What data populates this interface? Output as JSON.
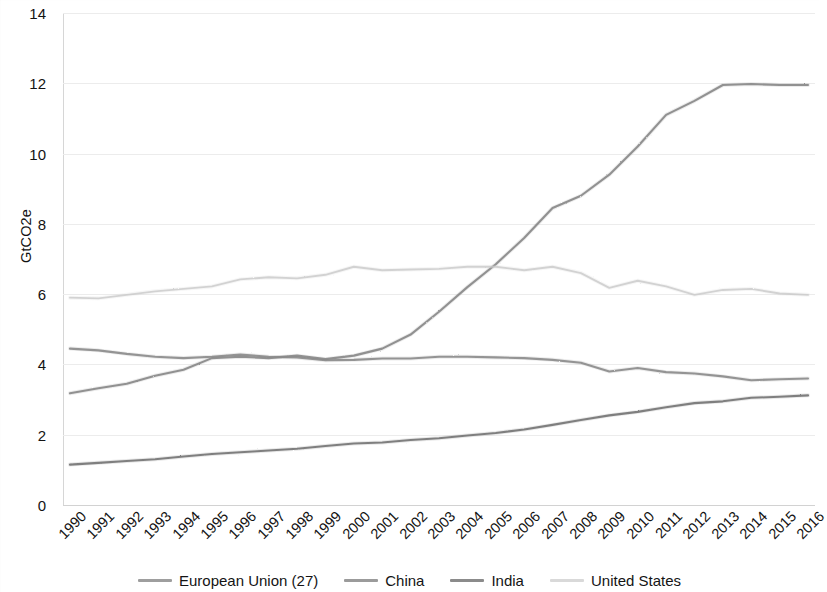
{
  "chart_data": {
    "type": "line",
    "title": "",
    "xlabel": "",
    "ylabel": "GtCO2e",
    "ylim": [
      0,
      14
    ],
    "yticks": [
      0,
      2,
      4,
      6,
      8,
      10,
      12,
      14
    ],
    "grid": true,
    "legend_position": "bottom",
    "x": [
      1990,
      1991,
      1992,
      1993,
      1994,
      1995,
      1996,
      1997,
      1998,
      1999,
      2000,
      2001,
      2002,
      2003,
      2004,
      2005,
      2006,
      2007,
      2008,
      2009,
      2010,
      2011,
      2012,
      2013,
      2014,
      2015,
      2016
    ],
    "categories": [
      "1990",
      "1991",
      "1992",
      "1993",
      "1994",
      "1995",
      "1996",
      "1997",
      "1998",
      "1999",
      "2000",
      "2001",
      "2002",
      "2003",
      "2004",
      "2005",
      "2006",
      "2007",
      "2008",
      "2009",
      "2010",
      "2011",
      "2012",
      "2013",
      "2014",
      "2015",
      "2016"
    ],
    "series": [
      {
        "name": "European Union (27)",
        "color": "#8d8d8d",
        "values": [
          4.45,
          4.4,
          4.3,
          4.22,
          4.18,
          4.22,
          4.28,
          4.22,
          4.2,
          4.12,
          4.13,
          4.17,
          4.17,
          4.22,
          4.22,
          4.2,
          4.18,
          4.13,
          4.05,
          3.8,
          3.9,
          3.78,
          3.74,
          3.66,
          3.55,
          3.58,
          3.6
        ]
      },
      {
        "name": "China",
        "color": "#8a8a8a",
        "values": [
          3.18,
          3.32,
          3.45,
          3.68,
          3.85,
          4.18,
          4.22,
          4.18,
          4.25,
          4.15,
          4.25,
          4.45,
          4.85,
          5.5,
          6.2,
          6.85,
          7.6,
          8.45,
          8.8,
          9.4,
          10.2,
          11.1,
          11.5,
          11.95,
          11.98,
          11.95,
          11.95
        ]
      },
      {
        "name": "India",
        "color": "#777777",
        "values": [
          1.15,
          1.2,
          1.25,
          1.3,
          1.38,
          1.45,
          1.5,
          1.55,
          1.6,
          1.68,
          1.75,
          1.78,
          1.85,
          1.9,
          1.98,
          2.05,
          2.15,
          2.28,
          2.42,
          2.55,
          2.65,
          2.78,
          2.9,
          2.95,
          3.05,
          3.08,
          3.12
        ]
      },
      {
        "name": "United States",
        "color": "#c9c9c9",
        "values": [
          5.9,
          5.88,
          5.98,
          6.08,
          6.15,
          6.22,
          6.42,
          6.48,
          6.45,
          6.55,
          6.78,
          6.68,
          6.7,
          6.72,
          6.78,
          6.78,
          6.68,
          6.78,
          6.6,
          6.18,
          6.38,
          6.22,
          5.98,
          6.12,
          6.15,
          6.02,
          5.98
        ]
      }
    ]
  },
  "legend": {
    "items": [
      {
        "label": "European Union (27)",
        "color": "#8d8d8d"
      },
      {
        "label": "China",
        "color": "#8a8a8a"
      },
      {
        "label": "India",
        "color": "#777777"
      },
      {
        "label": "United States",
        "color": "#c9c9c9"
      }
    ]
  }
}
